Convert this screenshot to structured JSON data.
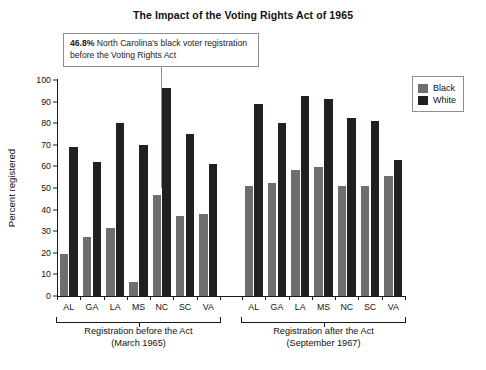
{
  "title": "The Impact of the Voting Rights Act of 1965",
  "annotation": {
    "value": "46.8%",
    "text": " North Carolina's black voter registration before the Voting Rights Act"
  },
  "legend": {
    "position": "top-right",
    "entries": [
      {
        "label": "Black",
        "color": "#6e6e6e"
      },
      {
        "label": "White",
        "color": "#231f20"
      }
    ]
  },
  "axis": {
    "ylabel": "Percent registered",
    "yticks": [
      "0",
      "10",
      "20",
      "30",
      "40",
      "50",
      "60",
      "70",
      "80",
      "90",
      "100"
    ]
  },
  "groups": [
    {
      "label_line1": "Registration before the Act",
      "label_line2": "(March 1965)"
    },
    {
      "label_line1": "Registration after the Act",
      "label_line2": "(September 1967)"
    }
  ],
  "chart_data": {
    "type": "bar",
    "title": "The Impact of the Voting Rights Act of 1965",
    "xlabel": "",
    "ylabel": "Percent registered",
    "ylim": [
      0,
      100
    ],
    "ytick_step": 10,
    "grid": false,
    "legend_position": "top-right",
    "group_labels": [
      "Registration before the Act (March 1965)",
      "Registration after the Act (September 1967)"
    ],
    "categories": [
      "AL",
      "GA",
      "LA",
      "MS",
      "NC",
      "SC",
      "VA"
    ],
    "panels": [
      {
        "name": "Registration before the Act (March 1965)",
        "series": [
          {
            "name": "Black",
            "color": "#6e6e6e",
            "values": [
              19.5,
              27.5,
              31.5,
              6.7,
              46.8,
              37.0,
              38.0
            ]
          },
          {
            "name": "White",
            "color": "#231f20",
            "values": [
              69.0,
              62.0,
              80.0,
              69.8,
              96.5,
              75.0,
              61.0
            ]
          }
        ]
      },
      {
        "name": "Registration after the Act (September 1967)",
        "series": [
          {
            "name": "Black",
            "color": "#6e6e6e",
            "values": [
              51.0,
              52.5,
              58.5,
              59.5,
              51.0,
              51.0,
              55.5
            ]
          },
          {
            "name": "White",
            "color": "#231f20",
            "values": [
              89.0,
              80.0,
              92.5,
              91.0,
              82.5,
              81.0,
              63.0
            ]
          }
        ]
      }
    ],
    "annotations": [
      {
        "text": "46.8% North Carolina's black voter registration before the Voting Rights Act",
        "points_to": {
          "panel": 0,
          "category": "NC",
          "series": "Black",
          "value": 46.8
        }
      }
    ]
  }
}
